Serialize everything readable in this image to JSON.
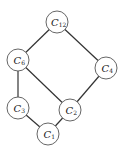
{
  "diagram": {
    "type": "hasse-diagram",
    "nodes": [
      {
        "id": "C12",
        "label": "C",
        "sub": "12",
        "x": 57,
        "y": 22
      },
      {
        "id": "C6",
        "label": "C",
        "sub": "6",
        "x": 18,
        "y": 60
      },
      {
        "id": "C4",
        "label": "C",
        "sub": "4",
        "x": 106,
        "y": 68
      },
      {
        "id": "C3",
        "label": "C",
        "sub": "3",
        "x": 18,
        "y": 108
      },
      {
        "id": "C2",
        "label": "C",
        "sub": "2",
        "x": 70,
        "y": 110
      },
      {
        "id": "C1",
        "label": "C",
        "sub": "1",
        "x": 48,
        "y": 134
      }
    ],
    "edges": [
      [
        "C12",
        "C6"
      ],
      [
        "C12",
        "C4"
      ],
      [
        "C6",
        "C3"
      ],
      [
        "C6",
        "C2"
      ],
      [
        "C4",
        "C2"
      ],
      [
        "C3",
        "C1"
      ],
      [
        "C2",
        "C1"
      ]
    ]
  }
}
